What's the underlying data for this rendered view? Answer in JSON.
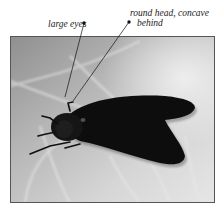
{
  "figure": {
    "annotations": [
      {
        "id": "eyes",
        "text": "large eyes"
      },
      {
        "id": "head",
        "line1": "round head, concave",
        "line2": "behind"
      }
    ],
    "caption_fragment": "",
    "colors": {
      "leaf_light": "#d9d9d9",
      "leaf_mid": "#a9a9a9",
      "fly_body": "#0d0d0d",
      "photo_border": "#555555",
      "label_text": "#222222"
    }
  }
}
